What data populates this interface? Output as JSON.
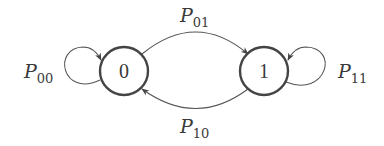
{
  "diagram": {
    "type": "markov-chain-state-diagram",
    "states": [
      {
        "id": "0",
        "label": "0"
      },
      {
        "id": "1",
        "label": "1"
      }
    ],
    "transitions": [
      {
        "from": "0",
        "to": "0",
        "label_main": "P",
        "label_sub": "00"
      },
      {
        "from": "0",
        "to": "1",
        "label_main": "P",
        "label_sub": "01"
      },
      {
        "from": "1",
        "to": "0",
        "label_main": "P",
        "label_sub": "10"
      },
      {
        "from": "1",
        "to": "1",
        "label_main": "P",
        "label_sub": "11"
      }
    ],
    "colors": {
      "stroke": "#444444",
      "text": "#3a3a3a",
      "background": "#ffffff"
    }
  }
}
